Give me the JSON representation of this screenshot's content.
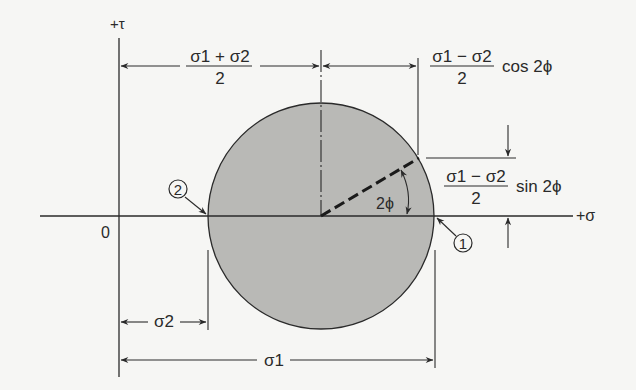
{
  "figure": {
    "colors": {
      "background": "#f6f6f4",
      "circle_fill": "#b9b9b6",
      "line": "#2a2a2a"
    },
    "axes": {
      "tau_label": "+τ",
      "sigma_label": "+σ",
      "origin_label": "0"
    },
    "dimensions": {
      "center_numerator": "σ1 + σ2",
      "center_denominator": "2",
      "cos_numerator": "σ1 − σ2",
      "cos_denominator": "2",
      "cos_suffix": "cos 2ϕ",
      "sin_numerator": "σ1 − σ2",
      "sin_denominator": "2",
      "sin_suffix": "sin 2ϕ",
      "angle_label": "2ϕ",
      "sigma2_label": "σ2",
      "sigma1_label": "σ1"
    },
    "points": [
      {
        "id": "1",
        "label": "1",
        "description": "point on circle at σ1"
      },
      {
        "id": "2",
        "label": "2",
        "description": "point on circle at σ2"
      }
    ]
  }
}
